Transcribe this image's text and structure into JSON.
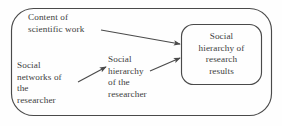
{
  "diagram": {
    "type": "flow-diagram",
    "colors": {
      "stroke": "#4a4a4a",
      "text": "#3d3d3d",
      "background": "#fefefe"
    },
    "outer_container": {
      "shape": "rounded-rectangle",
      "x": 11,
      "y": 8,
      "width": 261,
      "height": 108,
      "radius": 22
    },
    "nodes": [
      {
        "id": "content-of-scientific-work",
        "label": "Content of\nscientific work",
        "boxed": false
      },
      {
        "id": "social-networks-of-the-researcher",
        "label": "Social\nnetworks of\nthe\nresearcher",
        "boxed": false
      },
      {
        "id": "social-hierarchy-of-the-researcher",
        "label": "Social\nhierarchy\nof the\nresearcher",
        "boxed": false
      },
      {
        "id": "social-hierarchy-of-research-results",
        "label": "Social\nhierarchy of\nresearch\nresults",
        "boxed": true,
        "box": {
          "x": 181,
          "y": 24,
          "width": 81,
          "height": 61,
          "radius": 12
        }
      }
    ],
    "arrows": [
      {
        "id": "arrow-content-to-results",
        "from": "content-of-scientific-work",
        "to": "social-hierarchy-of-research-results",
        "x1": 101,
        "y1": 30,
        "x2": 180,
        "y2": 44
      },
      {
        "id": "arrow-networks-to-hierarchy-researcher",
        "from": "social-networks-of-the-researcher",
        "to": "social-hierarchy-of-the-researcher",
        "x1": 78,
        "y1": 82,
        "x2": 106,
        "y2": 67
      },
      {
        "id": "arrow-hierarchy-researcher-to-results",
        "from": "social-hierarchy-of-the-researcher",
        "to": "social-hierarchy-of-research-results",
        "x1": 150,
        "y1": 71,
        "x2": 180,
        "y2": 58
      }
    ]
  }
}
